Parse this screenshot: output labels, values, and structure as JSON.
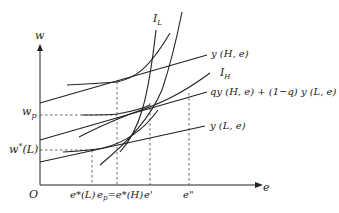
{
  "diagram": {
    "axes": {
      "y_label": "w",
      "x_label": "e",
      "origin_label": "O"
    },
    "y_ticks": [
      {
        "label_main": "w",
        "label_sub": "p"
      },
      {
        "label_main": "w",
        "label_sup": "*",
        "label_rest": "(L)"
      }
    ],
    "x_ticks": {
      "e_star_L": "e*(L)",
      "e_p_eq": "e",
      "e_p_sub": "p",
      "e_p_rest": "=e*(H)",
      "e_prime": "e'",
      "e_dprime": "e\""
    },
    "curve_labels": {
      "IL_main": "I",
      "IL_sub": "L",
      "IH_main": "I",
      "IH_sub": "H",
      "yH": "y (H, e)",
      "pooled": "qy (H, e) + (1−q) y (L, e)",
      "yL": "y (L, e)"
    }
  }
}
